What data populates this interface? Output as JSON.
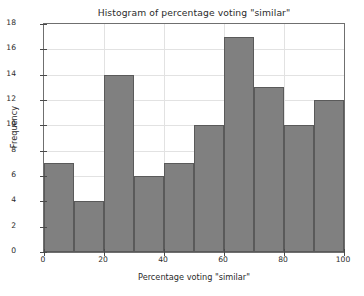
{
  "chart_data": {
    "type": "bar",
    "title": "Histogram of percentage voting \"similar\"",
    "xlabel": "Percentage voting \"similar\"",
    "ylabel": "Frequency",
    "xlim": [
      0,
      100
    ],
    "ylim": [
      0,
      18
    ],
    "grid": true,
    "legend": null,
    "bin_width": 10,
    "bin_edges": [
      0,
      10,
      20,
      30,
      40,
      50,
      60,
      70,
      80,
      90,
      100
    ],
    "categories": [
      "0-10",
      "10-20",
      "20-30",
      "30-40",
      "40-50",
      "50-60",
      "60-70",
      "70-80",
      "80-90",
      "90-100"
    ],
    "values": [
      7,
      4,
      14,
      6,
      7,
      10,
      17,
      13,
      10,
      12
    ],
    "xticks": [
      0,
      20,
      40,
      60,
      80,
      100
    ],
    "xtick_labels": [
      "0",
      "20",
      "40",
      "60",
      "80",
      "100"
    ],
    "yticks": [
      0,
      2,
      4,
      6,
      8,
      10,
      12,
      14,
      16,
      18
    ],
    "ytick_labels": [
      "0",
      "2",
      "4",
      "6",
      "8",
      "10",
      "12",
      "14",
      "16",
      "18"
    ],
    "colors": {
      "bar_fill": "#808080",
      "bar_edge": "#5a5a5a",
      "grid": "#e2e2e2",
      "axis": "#6f6f6f",
      "text": "#2b2b2b",
      "background": "#ffffff"
    }
  }
}
